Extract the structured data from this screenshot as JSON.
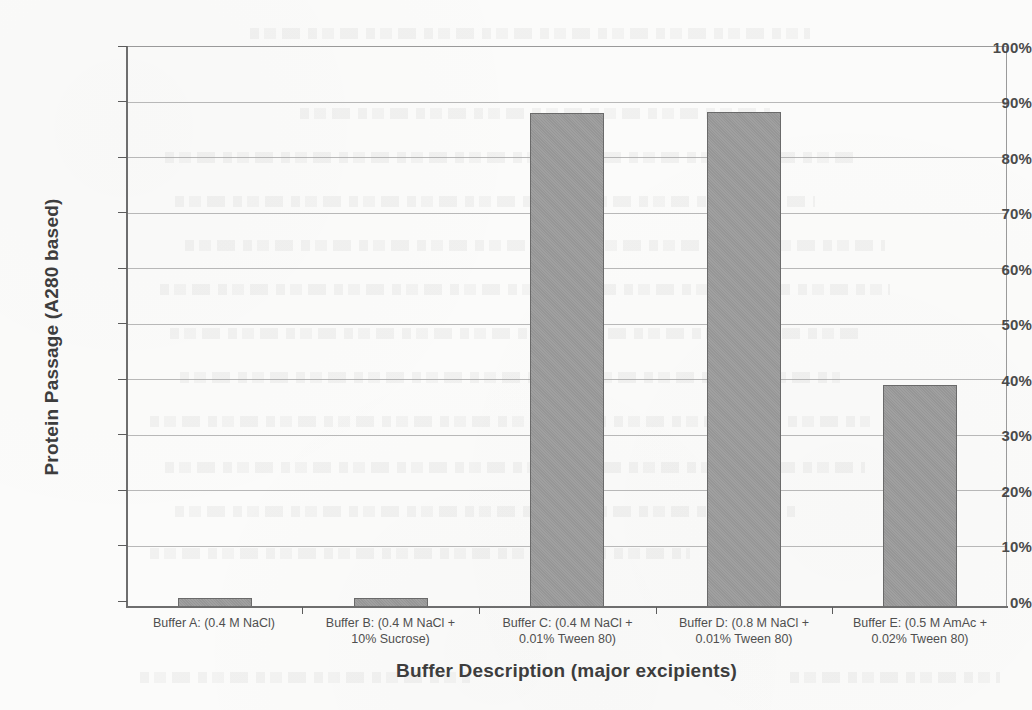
{
  "chart_data": {
    "type": "bar",
    "title": "",
    "xlabel": "Buffer Description (major excipients)",
    "ylabel": "Protein Passage (A280 based)",
    "ylim": [
      0,
      100
    ],
    "ytick_labels": [
      "100%",
      "90%",
      "80%",
      "70%",
      "60%",
      "50%",
      "40%",
      "30%",
      "20%",
      "10%",
      "0%"
    ],
    "ytick_values": [
      100,
      90,
      80,
      70,
      60,
      50,
      40,
      30,
      20,
      10,
      0
    ],
    "grid": true,
    "legend": false,
    "units": "percent",
    "bar_color": "#9b9b9b",
    "bar_edge_color": "#6a6a6a",
    "categories": [
      "Buffer A: (0.4 M NaCl)",
      "Buffer B: (0.4 M NaCl + 10% Sucrose)",
      "Buffer C: (0.4 M NaCl + 0.01% Tween 80)",
      "Buffer D: (0.8 M NaCl + 0.01% Tween 80)",
      "Buffer E: (0.5 M AmAc + 0.02% Tween 80)"
    ],
    "category_lines": [
      [
        "Buffer A: (0.4 M NaCl)",
        ""
      ],
      [
        "Buffer B: (0.4 M NaCl +",
        "10% Sucrose)"
      ],
      [
        "Buffer C: (0.4 M NaCl +",
        "0.01% Tween 80)"
      ],
      [
        "Buffer D: (0.8 M NaCl +",
        "0.01% Tween 80)"
      ],
      [
        "Buffer E: (0.5 M AmAc +",
        "0.02% Tween 80)"
      ]
    ],
    "values": [
      1.7,
      1.8,
      88.3,
      88.4,
      39.7
    ]
  }
}
